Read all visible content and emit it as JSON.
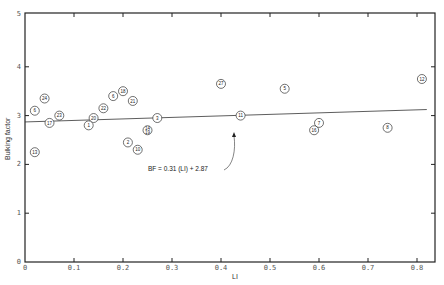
{
  "chart_data": {
    "type": "scatter",
    "title": "",
    "xlabel": "LI",
    "ylabel": "Bulking factor",
    "xlim": [
      0,
      0.85
    ],
    "ylim": [
      0,
      5
    ],
    "x_ticks": [
      "0",
      "0.1",
      "0.2",
      "0.3",
      "0.4",
      "0.5",
      "0.6",
      "0.7",
      "0.8"
    ],
    "y_ticks": [
      "0",
      "1",
      "2",
      "3",
      "4",
      "5"
    ],
    "grid": false,
    "legend": null,
    "points": [
      {
        "label": "6",
        "x": 0.02,
        "y": 3.1
      },
      {
        "label": "24",
        "x": 0.04,
        "y": 3.35
      },
      {
        "label": "17",
        "x": 0.05,
        "y": 2.85
      },
      {
        "label": "23",
        "x": 0.07,
        "y": 3.0
      },
      {
        "label": "13",
        "x": 0.02,
        "y": 2.25
      },
      {
        "label": "20",
        "x": 0.14,
        "y": 2.95
      },
      {
        "label": "1",
        "x": 0.13,
        "y": 2.8
      },
      {
        "label": "22",
        "x": 0.16,
        "y": 3.15
      },
      {
        "label": "6",
        "x": 0.18,
        "y": 3.4
      },
      {
        "label": "18",
        "x": 0.2,
        "y": 3.5
      },
      {
        "label": "21",
        "x": 0.22,
        "y": 3.3
      },
      {
        "label": "2",
        "x": 0.21,
        "y": 2.45
      },
      {
        "label": "10",
        "x": 0.23,
        "y": 2.3
      },
      {
        "label": "14 19",
        "x": 0.25,
        "y": 2.7
      },
      {
        "label": "3",
        "x": 0.27,
        "y": 2.95
      },
      {
        "label": "27",
        "x": 0.4,
        "y": 3.65
      },
      {
        "label": "11",
        "x": 0.44,
        "y": 3.0
      },
      {
        "label": "5",
        "x": 0.53,
        "y": 3.55
      },
      {
        "label": "7",
        "x": 0.6,
        "y": 2.85
      },
      {
        "label": "16",
        "x": 0.59,
        "y": 2.7
      },
      {
        "label": "8",
        "x": 0.74,
        "y": 2.75
      },
      {
        "label": "12",
        "x": 0.81,
        "y": 3.75
      }
    ],
    "regression": {
      "slope": 0.31,
      "intercept": 2.87,
      "x_range": [
        0,
        0.85
      ]
    },
    "annotations": [
      {
        "text": "BF = 0.31 (LI) + 2.87",
        "points_to": "regression line near LI 0.42"
      }
    ]
  },
  "caption_fragment": "... (1970)"
}
